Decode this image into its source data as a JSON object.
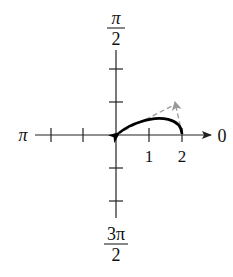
{
  "diagram": {
    "type": "polar-graph",
    "axis_labels": {
      "right": "0",
      "top_numerator": "π",
      "top_denominator": "2",
      "left": "π",
      "bottom_numerator": "3π",
      "bottom_denominator": "2"
    },
    "tick_labels": [
      "1",
      "2"
    ],
    "colors": {
      "axis": "#222222",
      "curve": "#000000",
      "dashed": "#999999"
    },
    "curve": {
      "description": "solid arc from r=2 on polar axis back to pole, arrow at pole",
      "start": [
        2,
        0
      ],
      "end": [
        0,
        0
      ]
    },
    "dashed_vectors": [
      {
        "from": [
          0,
          0
        ],
        "to": [
          1.85,
          0.9
        ]
      },
      {
        "from": [
          2,
          0
        ],
        "to": [
          1.85,
          0.95
        ],
        "arrow": true
      }
    ]
  }
}
